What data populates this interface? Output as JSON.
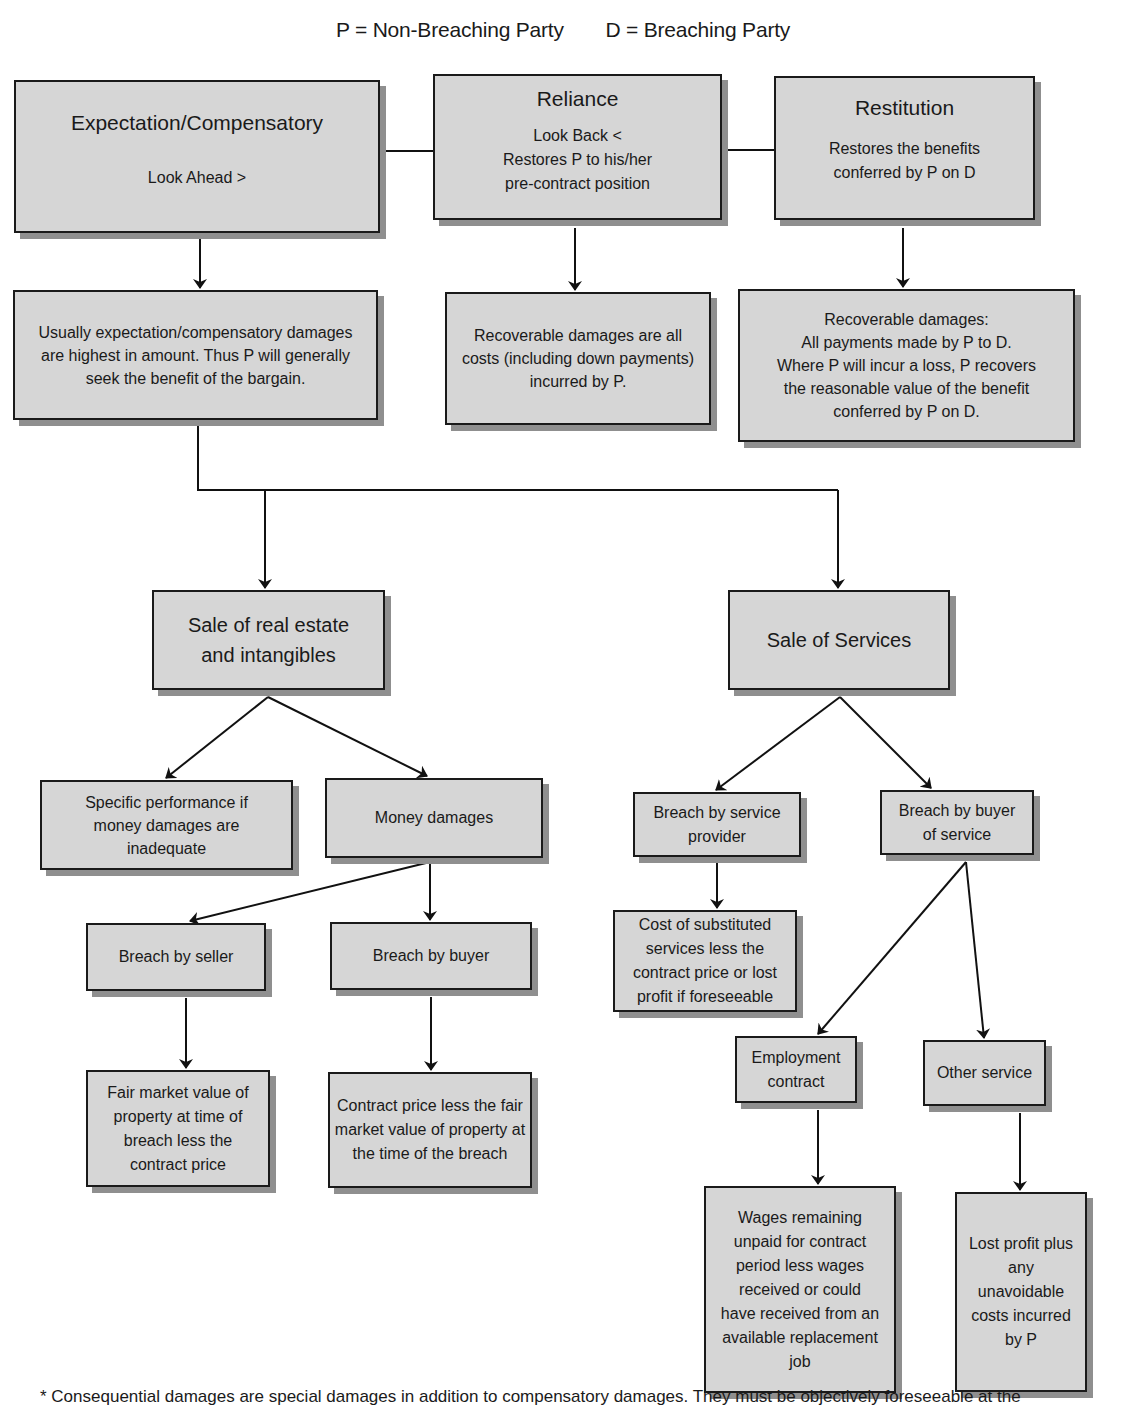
{
  "legend": {
    "p": "P = Non-Breaching Party",
    "d": "D = Breaching Party"
  },
  "top_row": {
    "expectation": {
      "title": "Expectation/Compensatory",
      "sub": "Look Ahead  >"
    },
    "reliance": {
      "title": "Reliance",
      "sub1": "Look Back  <",
      "sub2": "Restores P to his/her",
      "sub3": "pre-contract position"
    },
    "restitution": {
      "title": "Restitution",
      "sub1": "Restores the benefits",
      "sub2": "conferred by P on D"
    }
  },
  "detail_row": {
    "expectation": "Usually expectation/compensatory damages are highest in amount. Thus P will generally seek the benefit of the bargain.",
    "reliance": "Recoverable damages are all costs (including down payments) incurred by P.",
    "restitution_lines": [
      "Recoverable damages:",
      "All payments made by P to D.",
      "Where P will incur a loss, P recovers",
      "the reasonable value of the benefit",
      "conferred by P on D."
    ]
  },
  "real_estate": {
    "title": "Sale of real estate and intangibles",
    "specific_performance": "Specific performance if money damages are inadequate",
    "money_damages": "Money damages",
    "breach_by_seller": "Breach by seller",
    "breach_by_buyer": "Breach by buyer",
    "seller_remedy": "Fair market value of property at time of breach less the contract price",
    "buyer_remedy": "Contract price less the fair market value of property at the time of the breach"
  },
  "services": {
    "title": "Sale of Services",
    "breach_by_provider": "Breach by service provider",
    "breach_by_buyer": "Breach by buyer of service",
    "provider_remedy": "Cost of substituted services less the contract price or lost profit if foreseeable",
    "employment_contract": "Employment contract",
    "other_service": "Other service",
    "employment_remedy": "Wages remaining unpaid for contract period less wages received or could have received from an available replacement job",
    "other_remedy": "Lost profit plus any unavoidable costs incurred by P"
  },
  "footnote": "* Consequential damages are special damages in addition to compensatory damages. They must be objectively foreseeable at the"
}
